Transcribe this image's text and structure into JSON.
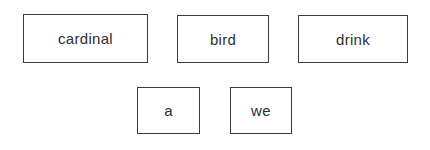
{
  "diagram": {
    "rows": [
      {
        "boxes": [
          {
            "label": "cardinal"
          },
          {
            "label": "bird"
          },
          {
            "label": "drink"
          }
        ]
      },
      {
        "boxes": [
          {
            "label": "a"
          },
          {
            "label": "we"
          }
        ]
      }
    ]
  }
}
